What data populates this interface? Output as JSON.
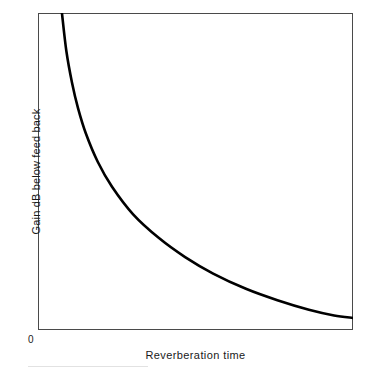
{
  "figure": {
    "background_color": "#ffffff",
    "frame_color": "#4a4a4a",
    "curve_color": "#000000"
  },
  "axes": {
    "origin_label": "0",
    "x_axis_label": "Reverberation time",
    "y_axis_label": "Gain dB below feed back"
  },
  "chart_data": {
    "type": "line",
    "title": "",
    "subtitle": "",
    "xlabel": "Reverberation time",
    "ylabel": "Gain dB below feed back",
    "xlim": [
      0,
      1
    ],
    "ylim": [
      0,
      1
    ],
    "grid": false,
    "legend": null,
    "legend_position": "none",
    "xticks": [],
    "xticklabels": [],
    "yticks": [
      0
    ],
    "yticklabels": [
      "0"
    ],
    "annotations": [],
    "series": [
      {
        "name": "Gain below feed back vs reverberation time",
        "color": "#000000",
        "line_width": 2.6,
        "x": [
          0.076,
          0.09,
          0.108,
          0.127,
          0.152,
          0.19,
          0.235,
          0.302,
          0.384,
          0.467,
          0.556,
          0.66,
          0.76,
          0.86,
          0.94,
          1.0
        ],
        "y": [
          1.0,
          0.88,
          0.78,
          0.7,
          0.62,
          0.53,
          0.452,
          0.365,
          0.29,
          0.23,
          0.178,
          0.13,
          0.094,
          0.064,
          0.046,
          0.038
        ]
      }
    ]
  }
}
